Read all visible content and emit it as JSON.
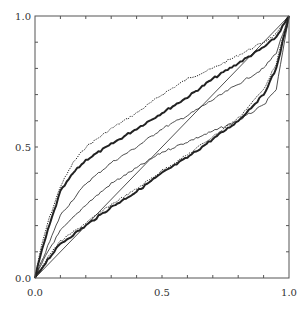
{
  "chart_data": {
    "type": "line",
    "title": "",
    "xlabel": "",
    "ylabel": "",
    "xlim": [
      0,
      1
    ],
    "ylim": [
      0,
      1
    ],
    "grid": false,
    "legend": null,
    "x_ticks": [
      0.0,
      0.5,
      1.0
    ],
    "x_tick_labels": [
      "0.0",
      "0.5",
      "1.0"
    ],
    "y_ticks": [
      0.0,
      0.5,
      1.0
    ],
    "y_tick_labels": [
      "0.0",
      "0.5",
      "1.0"
    ],
    "series": [
      {
        "name": "curve-upper-dotted",
        "style": "dotted",
        "width": 1.0,
        "x": [
          0,
          0.02,
          0.05,
          0.1,
          0.15,
          0.2,
          0.3,
          0.4,
          0.5,
          0.6,
          0.7,
          0.8,
          0.9,
          0.95,
          1.0
        ],
        "y": [
          0,
          0.1,
          0.21,
          0.35,
          0.44,
          0.5,
          0.57,
          0.63,
          0.7,
          0.76,
          0.8,
          0.85,
          0.9,
          0.93,
          1.0
        ]
      },
      {
        "name": "curve-upper-thick",
        "style": "solid",
        "width": 2.0,
        "x": [
          0,
          0.02,
          0.05,
          0.1,
          0.15,
          0.2,
          0.3,
          0.4,
          0.5,
          0.6,
          0.7,
          0.8,
          0.9,
          0.95,
          1.0
        ],
        "y": [
          0,
          0.08,
          0.18,
          0.33,
          0.4,
          0.45,
          0.51,
          0.57,
          0.63,
          0.69,
          0.76,
          0.82,
          0.88,
          0.92,
          1.0
        ]
      },
      {
        "name": "curve-mid-upper-thin",
        "style": "solid",
        "width": 0.8,
        "x": [
          0,
          0.05,
          0.1,
          0.2,
          0.3,
          0.4,
          0.5,
          0.6,
          0.7,
          0.8,
          0.9,
          0.95,
          1.0
        ],
        "y": [
          0,
          0.12,
          0.24,
          0.36,
          0.44,
          0.5,
          0.57,
          0.62,
          0.68,
          0.74,
          0.8,
          0.86,
          1.0
        ]
      },
      {
        "name": "curve-mid-thin",
        "style": "solid",
        "width": 0.8,
        "x": [
          0,
          0.05,
          0.1,
          0.2,
          0.3,
          0.4,
          0.5,
          0.6,
          0.7,
          0.8,
          0.9,
          0.95,
          1.0
        ],
        "y": [
          0,
          0.1,
          0.18,
          0.28,
          0.36,
          0.42,
          0.48,
          0.52,
          0.56,
          0.6,
          0.66,
          0.72,
          1.0
        ]
      },
      {
        "name": "diagonal",
        "style": "solid",
        "width": 0.8,
        "x": [
          0,
          1.0
        ],
        "y": [
          0,
          1.0
        ]
      },
      {
        "name": "curve-lower-thick",
        "style": "solid",
        "width": 2.0,
        "x": [
          0,
          0.05,
          0.1,
          0.2,
          0.3,
          0.4,
          0.5,
          0.6,
          0.7,
          0.8,
          0.9,
          0.95,
          1.0
        ],
        "y": [
          0,
          0.07,
          0.13,
          0.2,
          0.27,
          0.33,
          0.4,
          0.46,
          0.53,
          0.6,
          0.7,
          0.8,
          1.0
        ]
      },
      {
        "name": "curve-lower-dotted",
        "style": "dotted",
        "width": 1.0,
        "x": [
          0,
          0.05,
          0.1,
          0.2,
          0.3,
          0.4,
          0.5,
          0.6,
          0.7,
          0.8,
          0.9,
          0.95,
          1.0
        ],
        "y": [
          0,
          0.08,
          0.14,
          0.21,
          0.28,
          0.34,
          0.41,
          0.47,
          0.54,
          0.61,
          0.72,
          0.82,
          1.0
        ]
      }
    ]
  },
  "layout": {
    "plot_left": 35,
    "plot_right": 289,
    "plot_top": 16,
    "plot_bottom": 278,
    "line_color": "#222222",
    "axis_color": "#555555"
  }
}
